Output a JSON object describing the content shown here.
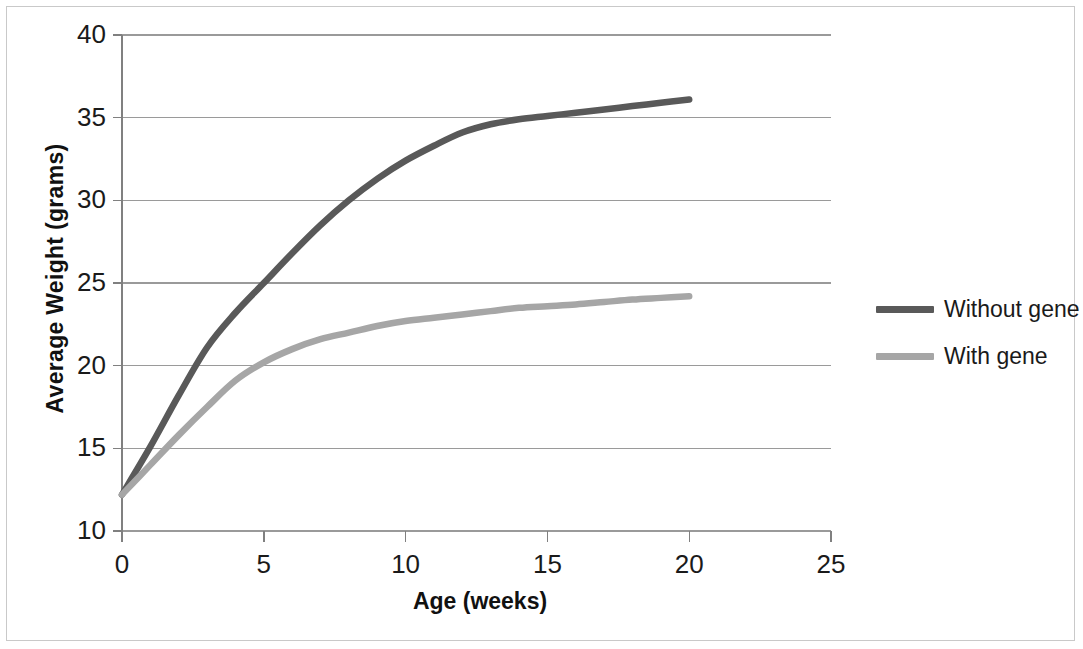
{
  "chart_data": {
    "type": "line",
    "title": "",
    "xlabel": "Age (weeks)",
    "ylabel": "Average Weight  (grams)",
    "xlim": [
      0,
      25
    ],
    "ylim": [
      10,
      40
    ],
    "xticks": [
      0,
      5,
      10,
      15,
      20,
      25
    ],
    "yticks": [
      10,
      15,
      20,
      25,
      30,
      35,
      40
    ],
    "xtick_labels": [
      "0",
      "5",
      "10",
      "15",
      "20",
      "25"
    ],
    "ytick_labels": [
      "10",
      "15",
      "20",
      "25",
      "30",
      "35",
      "40"
    ],
    "grid": "horizontal",
    "legend_position": "right",
    "x": [
      0,
      1,
      2,
      3,
      4,
      5,
      6,
      7,
      8,
      9,
      10,
      11,
      12,
      13,
      14,
      15,
      16,
      17,
      18,
      19,
      20
    ],
    "series": [
      {
        "name": "Without gene",
        "color": "#595959",
        "values": [
          12.2,
          15.1,
          18.2,
          21.1,
          23.2,
          25.0,
          26.8,
          28.5,
          30.0,
          31.3,
          32.4,
          33.3,
          34.1,
          34.6,
          34.9,
          35.1,
          35.3,
          35.5,
          35.7,
          35.9,
          36.1
        ]
      },
      {
        "name": "With gene",
        "color": "#a6a6a6",
        "values": [
          12.2,
          14.0,
          15.8,
          17.5,
          19.1,
          20.2,
          21.0,
          21.6,
          22.0,
          22.4,
          22.7,
          22.9,
          23.1,
          23.3,
          23.5,
          23.6,
          23.7,
          23.85,
          24.0,
          24.1,
          24.2
        ]
      }
    ]
  },
  "legend": {
    "items": [
      {
        "label": "Without gene",
        "color": "#595959"
      },
      {
        "label": "With gene",
        "color": "#a6a6a6"
      }
    ]
  },
  "axes": {
    "x_title": "Age (weeks)",
    "y_title": "Average Weight  (grams)"
  },
  "colors": {
    "axis": "#808080",
    "grid": "#9a9a9a",
    "text": "#1a1a1a",
    "frame": "#c9c9c9"
  }
}
